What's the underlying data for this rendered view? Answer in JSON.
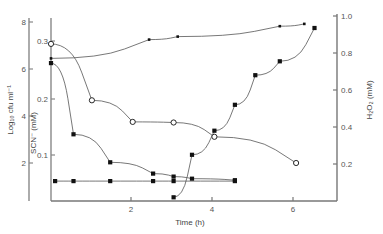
{
  "figure": {
    "background": "#ffffff",
    "line_color": "#555555",
    "axis_color": "#777777",
    "marker_filled_color": "#111111",
    "marker_open_fill": "#ffffff"
  },
  "chart_data": {
    "type": "line",
    "title": "",
    "xlabel": "Time (h)",
    "xlim": [
      0,
      7
    ],
    "xticks": [
      2,
      4,
      6
    ],
    "xticklabels": [
      "2",
      "4",
      "6"
    ],
    "grid": false,
    "legend_position": "none",
    "axes": [
      {
        "id": "cfu",
        "side": "left-outer",
        "label": "Log₁₀ cfu ml⁻¹",
        "ylim": [
          1.2,
          8.4
        ],
        "yticks": [
          2,
          4,
          6,
          8
        ],
        "yticklabels": [
          "2",
          "4",
          "6",
          "8"
        ]
      },
      {
        "id": "scn",
        "side": "left-inner",
        "label": "SCN⁻ (mM)",
        "ylim": [
          0.0,
          0.33
        ],
        "yticks": [
          0.1,
          0.2,
          0.3
        ],
        "yticklabels": [
          "0.1",
          "0.2",
          "0.3"
        ]
      },
      {
        "id": "h2o2",
        "side": "right",
        "label": "H₂O₂ (mM)",
        "ylim": [
          0.0,
          1.04
        ],
        "yticks": [
          0.2,
          0.4,
          0.6,
          0.8,
          1.0
        ],
        "yticklabels": [
          "0.2",
          "0.4",
          "0.6",
          "0.8",
          "1.0"
        ]
      }
    ],
    "series": [
      {
        "name": "Log10 cfu ml-1 (control, rising)",
        "axis": "cfu",
        "marker": "filled-square-small",
        "x": [
          0.0,
          2.4,
          3.1,
          5.6,
          6.2
        ],
        "y": [
          6.45,
          7.25,
          7.38,
          7.82,
          7.92
        ]
      },
      {
        "name": "Log10 cfu ml-1 (treated, falling)",
        "axis": "cfu",
        "marker": "filled-square",
        "x": [
          0.0,
          0.55,
          1.45,
          2.5,
          3.0,
          3.45,
          4.5
        ],
        "y": [
          6.25,
          3.22,
          2.03,
          1.55,
          1.42,
          1.33,
          1.27
        ]
      },
      {
        "name": "Log10 cfu ml-1 (baseline, detection limit)",
        "axis": "cfu",
        "marker": "filled-square",
        "x": [
          0.1,
          0.55,
          1.45,
          2.5,
          3.0,
          4.5
        ],
        "y": [
          1.23,
          1.23,
          1.23,
          1.23,
          1.23,
          1.23
        ]
      },
      {
        "name": "SCN- (mM)",
        "axis": "scn",
        "marker": "open-circle",
        "x": [
          0.0,
          1.0,
          2.0,
          3.0,
          4.0,
          6.0
        ],
        "y": [
          0.295,
          0.196,
          0.158,
          0.157,
          0.132,
          0.086
        ]
      },
      {
        "name": "H2O2 (mM)",
        "axis": "h2o2",
        "marker": "filled-square",
        "x": [
          3.0,
          3.45,
          4.0,
          4.5,
          5.0,
          5.6,
          6.45
        ],
        "y": [
          0.02,
          0.25,
          0.38,
          0.52,
          0.68,
          0.755,
          0.935
        ]
      }
    ]
  }
}
